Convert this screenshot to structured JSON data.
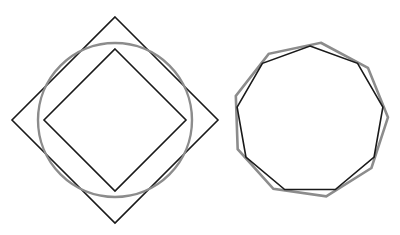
{
  "caption": {
    "text": "bei eben nur die aus einbeschriebenem 4- und 8-Eck.",
    "visible_fragment": "partially clipped line of text at top edge"
  },
  "figure": {
    "background_color": "#ffffff",
    "stroke_black": "#1a1a1a",
    "stroke_gray": "#8c8c8c",
    "left_figure": {
      "name": "square-circle-square",
      "description": "Large square rotated 45 degrees (diamond) with an inscribed circle and a smaller square rotated 45 degrees inscribed in that circle",
      "center_x": 115,
      "center_y": 120,
      "outer_square_half_diagonal": 103,
      "circle_radius": 77,
      "inner_square_half_diagonal": 71,
      "outer_square_color": "#1a1a1a",
      "circle_color": "#8c8c8c",
      "inner_square_color": "#1a1a1a"
    },
    "right_figure": {
      "name": "double-nonagon",
      "description": "Two regular nine-sided polygons (nonagons) of nearly equal size, one black and one gray, rotated slightly with respect to one another",
      "center_x": 310,
      "center_y": 120,
      "sides": 9,
      "black_nonagon_radius": 74,
      "gray_nonagon_radius": 78,
      "black_nonagon_rotation_deg": -90,
      "gray_nonagon_rotation_deg": -82,
      "black_nonagon_color": "#1a1a1a",
      "gray_nonagon_color": "#8c8c8c"
    }
  }
}
